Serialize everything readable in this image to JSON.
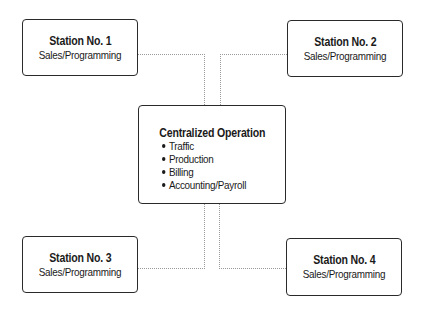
{
  "diagram": {
    "type": "hub-and-spoke organization diagram",
    "center": {
      "title": "Centralized Operation",
      "items": [
        "Traffic",
        "Production",
        "Billing",
        "Accounting/Payroll"
      ]
    },
    "stations": [
      {
        "title": "Station No. 1",
        "subtitle": "Sales/Programming"
      },
      {
        "title": "Station No. 2",
        "subtitle": "Sales/Programming"
      },
      {
        "title": "Station No. 3",
        "subtitle": "Sales/Programming"
      },
      {
        "title": "Station No. 4",
        "subtitle": "Sales/Programming"
      }
    ],
    "connections": [
      [
        "Station No. 1",
        "Centralized Operation"
      ],
      [
        "Station No. 2",
        "Centralized Operation"
      ],
      [
        "Station No. 3",
        "Centralized Operation"
      ],
      [
        "Station No. 4",
        "Centralized Operation"
      ]
    ],
    "colors": {
      "box_border": "#2a2a2a",
      "connector": "#9a9a9a",
      "text": "#1a1a1a",
      "background": "#ffffff"
    }
  }
}
